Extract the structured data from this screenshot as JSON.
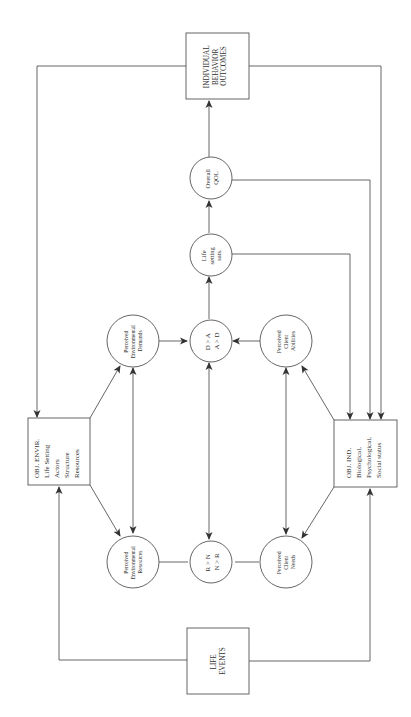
{
  "diagram": {
    "orientation": "rotated-90-ccw",
    "nodes": {
      "outcomes": {
        "shape": "box",
        "lines": [
          "INDIVIDUAL",
          "BEHAVIOR",
          "OUTCOMES"
        ]
      },
      "overall_qol": {
        "shape": "circle",
        "lines": [
          "Overall",
          "QOL"
        ]
      },
      "life_setting_sats": {
        "shape": "circle",
        "lines": [
          "Life",
          "setting",
          "sats."
        ]
      },
      "da_compare": {
        "shape": "circle",
        "lines": [
          "D > A",
          "A > D"
        ]
      },
      "rn_compare": {
        "shape": "circle",
        "lines": [
          "R > N",
          "N > R"
        ]
      },
      "env_demands": {
        "shape": "circle",
        "lines": [
          "Perceived",
          "Environmental",
          "Demands"
        ]
      },
      "client_abilities": {
        "shape": "circle",
        "lines": [
          "Perceived",
          "Client",
          "Abilities"
        ]
      },
      "env_resources": {
        "shape": "circle",
        "lines": [
          "Perceived",
          "Environmental",
          "Resources"
        ]
      },
      "client_needs": {
        "shape": "circle",
        "lines": [
          "Perceived",
          "Client",
          "Needs"
        ]
      },
      "obj_envir": {
        "shape": "box",
        "lines": [
          "OBJ. ENVIR.",
          "Life Setting",
          "Actors",
          "Structure",
          "Resources"
        ]
      },
      "obj_ind": {
        "shape": "box",
        "lines": [
          "OBJ. IND.",
          "Biological,",
          "Psychological,",
          "Social status"
        ]
      },
      "life_events": {
        "shape": "box",
        "lines": [
          "LIFE",
          "EVENTS"
        ]
      }
    },
    "edges": [
      {
        "from": "life_events",
        "to": "obj_envir"
      },
      {
        "from": "life_events",
        "to": "obj_ind"
      },
      {
        "from": "obj_envir",
        "to": "env_demands"
      },
      {
        "from": "obj_envir",
        "to": "env_resources"
      },
      {
        "from": "obj_ind",
        "to": "client_abilities"
      },
      {
        "from": "obj_ind",
        "to": "client_needs"
      },
      {
        "from": "env_demands",
        "to": "env_resources",
        "bidirectional": true
      },
      {
        "from": "client_abilities",
        "to": "client_needs",
        "bidirectional": true
      },
      {
        "from": "da_compare",
        "to": "rn_compare",
        "bidirectional": true
      },
      {
        "from": "env_demands",
        "to": "da_compare"
      },
      {
        "from": "client_abilities",
        "to": "da_compare"
      },
      {
        "from": "env_resources",
        "to": "rn_compare",
        "undirected": true
      },
      {
        "from": "client_needs",
        "to": "rn_compare",
        "undirected": true
      },
      {
        "from": "da_compare",
        "to": "life_setting_sats"
      },
      {
        "from": "life_setting_sats",
        "to": "overall_qol"
      },
      {
        "from": "overall_qol",
        "to": "outcomes"
      },
      {
        "from": "life_setting_sats",
        "to": "obj_ind"
      },
      {
        "from": "overall_qol",
        "to": "obj_ind"
      },
      {
        "from": "outcomes",
        "to": "obj_ind"
      },
      {
        "from": "outcomes",
        "to": "obj_envir"
      }
    ]
  }
}
